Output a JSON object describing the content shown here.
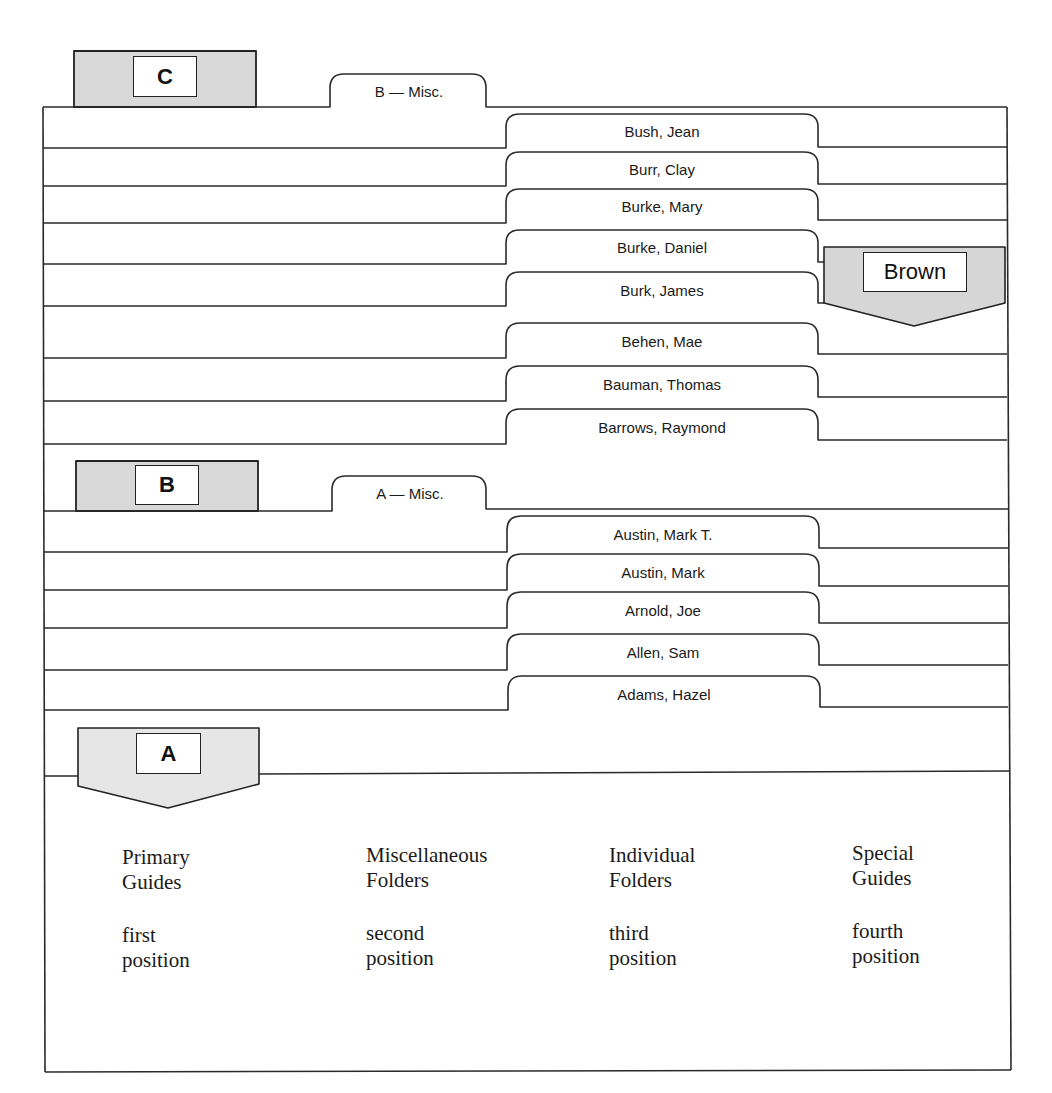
{
  "diagram": {
    "colors": {
      "line": "#2a2a2a",
      "guide_fill": "#d8d8d8",
      "special_guide_fill": "#d6d6d6",
      "a_guide_fill": "#e6e6e6",
      "label_fill": "#ffffff",
      "background": "#ffffff"
    },
    "primary_guides": [
      {
        "id": "C",
        "label": "C"
      },
      {
        "id": "B",
        "label": "B"
      },
      {
        "id": "A",
        "label": "A"
      }
    ],
    "misc_folders": [
      {
        "id": "b-misc",
        "label": "B — Misc."
      },
      {
        "id": "a-misc",
        "label": "A — Misc."
      }
    ],
    "individual_folders": [
      {
        "label": "Bush, Jean"
      },
      {
        "label": "Burr, Clay"
      },
      {
        "label": "Burke, Mary"
      },
      {
        "label": "Burke, Daniel"
      },
      {
        "label": "Burk, James"
      },
      {
        "label": "Behen, Mae"
      },
      {
        "label": "Bauman, Thomas"
      },
      {
        "label": "Barrows, Raymond"
      },
      {
        "label": "Austin, Mark T."
      },
      {
        "label": "Austin, Mark"
      },
      {
        "label": "Arnold, Joe"
      },
      {
        "label": "Allen, Sam"
      },
      {
        "label": "Adams, Hazel"
      }
    ],
    "special_guides": [
      {
        "id": "brown",
        "label": "Brown"
      }
    ]
  },
  "legend": {
    "columns": [
      {
        "title_line1": "Primary",
        "title_line2": "Guides",
        "pos_line1": "first",
        "pos_line2": "position"
      },
      {
        "title_line1": "Miscellaneous",
        "title_line2": "Folders",
        "pos_line1": "second",
        "pos_line2": "position"
      },
      {
        "title_line1": "Individual",
        "title_line2": "Folders",
        "pos_line1": "third",
        "pos_line2": "position"
      },
      {
        "title_line1": "Special",
        "title_line2": "Guides",
        "pos_line1": "fourth",
        "pos_line2": "position"
      }
    ]
  }
}
